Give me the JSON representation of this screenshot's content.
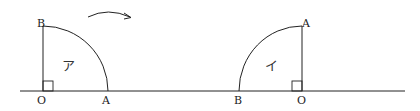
{
  "diagram": {
    "left_figure": {
      "region_label": "ア",
      "points": {
        "O": "O",
        "A": "A",
        "B": "B"
      }
    },
    "right_figure": {
      "region_label": "イ",
      "points": {
        "O": "O",
        "A": "A",
        "B": "B"
      }
    },
    "arrow": "rotation-arrow",
    "colors": {
      "stroke": "#222222",
      "background": "#ffffff"
    }
  }
}
